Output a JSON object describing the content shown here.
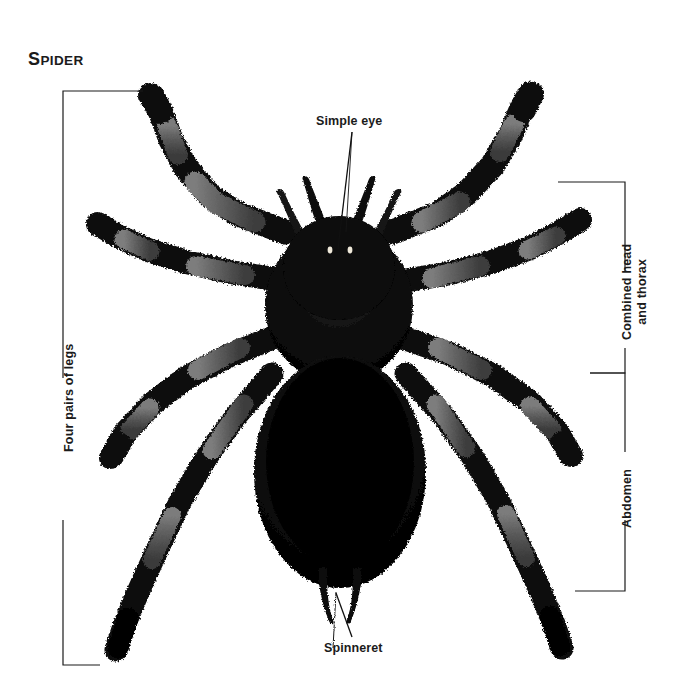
{
  "page": {
    "background": "#ffffff",
    "ink": "#1b1b1b",
    "width": 677,
    "height": 699
  },
  "title": {
    "initial": "S",
    "rest": "PIDER",
    "full": "SPIDER"
  },
  "callouts": [
    {
      "id": "simple-eye",
      "label": "Simple eye"
    },
    {
      "id": "spinneret",
      "label": "Spinneret"
    }
  ],
  "brackets": {
    "left": {
      "id": "four-pairs-of-legs",
      "label": "Four pairs of legs",
      "side": "left"
    },
    "right_top": {
      "id": "combined-head-and-thorax",
      "label_line1": "Combined head",
      "label_line2": "and thorax",
      "side": "right"
    },
    "right_bottom": {
      "id": "abdomen",
      "label": "Abdomen",
      "side": "right"
    }
  },
  "figure": {
    "name": "spider-photograph",
    "colors": {
      "body_dark": "#0a0a0a",
      "leg_band_mid": "#4a4a4a",
      "leg_band_light": "#6e6e6e",
      "eye_highlight": "#e8e4d8",
      "backdrop": "#ffffff"
    },
    "parts": {
      "cephalothorax": "combined head and thorax",
      "abdomen": "abdomen",
      "legs_count": 8,
      "leg_pairs": 4,
      "pedipalps": 2,
      "spinnerets": 2,
      "simple_eyes": 2
    }
  },
  "icons": {
    "bracket": "bracket-line",
    "leader": "leader-line"
  }
}
